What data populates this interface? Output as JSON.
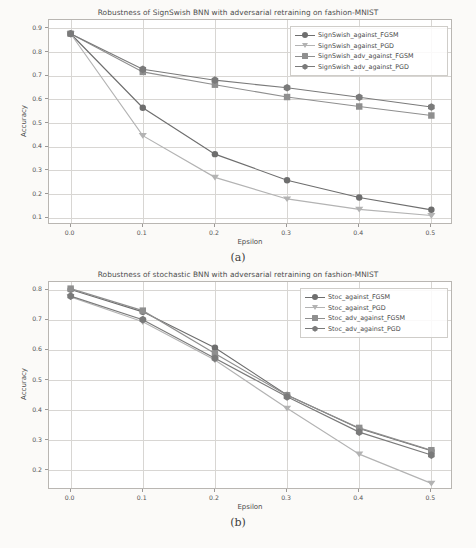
{
  "figure": {
    "background": "#fbfaf8",
    "captions": [
      {
        "id": "caption-a",
        "text": "(a)"
      },
      {
        "id": "caption-b",
        "text": "(b)"
      }
    ]
  },
  "chart_data": [
    {
      "id": "panel-a",
      "type": "line",
      "title": "Robustness of SignSwish BNN with adversarial retraining on fashion-MNIST",
      "xlabel": "Epsilon",
      "ylabel": "Accuracy",
      "x": [
        0.0,
        0.1,
        0.2,
        0.3,
        0.4,
        0.5
      ],
      "xticks": [
        "0.0",
        "0.1",
        "0.2",
        "0.3",
        "0.4",
        "0.5"
      ],
      "yticks": [
        "0.1",
        "0.2",
        "0.3",
        "0.4",
        "0.5",
        "0.6",
        "0.7",
        "0.8",
        "0.9"
      ],
      "xlim": [
        -0.03,
        0.53
      ],
      "ylim": [
        0.07,
        0.935
      ],
      "grid": true,
      "legend_position": "upper right",
      "series": [
        {
          "name": "SignSwish_against_FGSM",
          "marker": "circle",
          "color": "#6e6e6e",
          "values": [
            0.877,
            0.565,
            0.369,
            0.259,
            0.186,
            0.134
          ]
        },
        {
          "name": "SignSwish_against_PGD",
          "marker": "triangle-down",
          "color": "#b3b3b3",
          "values": [
            0.877,
            0.447,
            0.271,
            0.18,
            0.136,
            0.11
          ]
        },
        {
          "name": "SignSwish_adv_against_FGSM",
          "marker": "square",
          "color": "#8f8f8f",
          "values": [
            0.877,
            0.716,
            0.662,
            0.61,
            0.57,
            0.532
          ]
        },
        {
          "name": "SignSwish_adv_against_PGD",
          "marker": "hexagon",
          "color": "#7a7a7a",
          "values": [
            0.877,
            0.727,
            0.681,
            0.649,
            0.609,
            0.568
          ]
        }
      ]
    },
    {
      "id": "panel-b",
      "type": "line",
      "title": "Robustness of stochastic BNN with adversarial retraining on fashion-MNIST",
      "xlabel": "Epsilon",
      "ylabel": "Accuracy",
      "x": [
        0.0,
        0.1,
        0.2,
        0.3,
        0.4,
        0.5
      ],
      "xticks": [
        "0.0",
        "0.1",
        "0.2",
        "0.3",
        "0.4",
        "0.5"
      ],
      "yticks": [
        "0.2",
        "0.3",
        "0.4",
        "0.5",
        "0.6",
        "0.7",
        "0.8"
      ],
      "xlim": [
        -0.03,
        0.53
      ],
      "ylim": [
        0.135,
        0.825
      ],
      "grid": true,
      "legend_position": "upper right",
      "series": [
        {
          "name": "Stoc_against_FGSM",
          "marker": "circle",
          "color": "#6e6e6e",
          "values": [
            0.8,
            0.726,
            0.607,
            0.45,
            0.339,
            0.265
          ]
        },
        {
          "name": "Stoc_against_PGD",
          "marker": "triangle-down",
          "color": "#b3b3b3",
          "values": [
            0.775,
            0.693,
            0.566,
            0.406,
            0.254,
            0.157
          ]
        },
        {
          "name": "Stoc_adv_against_FGSM",
          "marker": "square",
          "color": "#8f8f8f",
          "values": [
            0.803,
            0.73,
            0.588,
            0.449,
            0.341,
            0.267
          ]
        },
        {
          "name": "Stoc_adv_against_PGD",
          "marker": "hexagon",
          "color": "#7a7a7a",
          "values": [
            0.778,
            0.7,
            0.572,
            0.444,
            0.327,
            0.251
          ]
        }
      ]
    }
  ]
}
